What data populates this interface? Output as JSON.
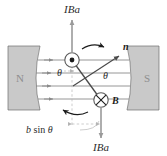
{
  "figure": {
    "background": "#ffffff"
  },
  "poles": {
    "left": {
      "label": "N",
      "fill": "#c9c9c9",
      "stroke": "#6f6f6f"
    },
    "right": {
      "label": "S",
      "fill": "#c9c9c9",
      "stroke": "#6f6f6f"
    }
  },
  "labels": {
    "force_top": "IBa",
    "force_bottom": "IBa",
    "normal_vector": "n",
    "field_vector": "B",
    "theta_left": "θ",
    "theta_right": "θ",
    "distance_prefix": "b",
    "distance_sin": " sin ",
    "distance_angle": "θ"
  },
  "icons": {
    "current_out_of_page": "circle-dot-icon",
    "current_into_page": "circle-cross-icon",
    "force_arrow_up": "arrow-up-icon",
    "force_arrow_down": "arrow-down-icon",
    "rotation_arrow_top": "curved-arrow-icon",
    "rotation_arrow_bottom": "curved-arrow-icon",
    "normal_arrow": "arrow-diagonal-icon"
  },
  "field": {
    "line_count": 4,
    "color": "#8a8a8a",
    "direction": "left-to-right"
  },
  "colors": {
    "magnet_fill": "#c9c9c9",
    "magnet_stroke": "#6f6f6f",
    "field_line": "#8a8a8a",
    "coil_line": "#5a5a5a",
    "arrow_gray": "#9a9a9a",
    "text": "#2b2b2b",
    "dashed": "#b4b4b4"
  }
}
